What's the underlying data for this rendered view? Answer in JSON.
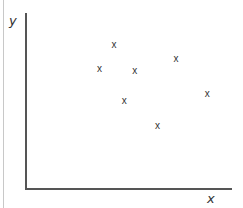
{
  "chart_data": {
    "type": "scatter",
    "title": "",
    "xlabel": "x",
    "ylabel": "y",
    "xlim": [
      0,
      10
    ],
    "ylim": [
      0,
      10
    ],
    "grid": false,
    "legend": null,
    "marker": "x",
    "series": [
      {
        "name": "points",
        "x": [
          3.6,
          4.3,
          5.3,
          4.8,
          6.4,
          7.3,
          8.8
        ],
        "y": [
          6.8,
          8.2,
          6.7,
          5.0,
          3.6,
          7.4,
          5.4
        ]
      }
    ]
  },
  "labels": {
    "x_axis": "x",
    "y_axis": "y",
    "marker_glyph": "x"
  },
  "colors": {
    "axis": "#555555",
    "text": "#333333"
  }
}
